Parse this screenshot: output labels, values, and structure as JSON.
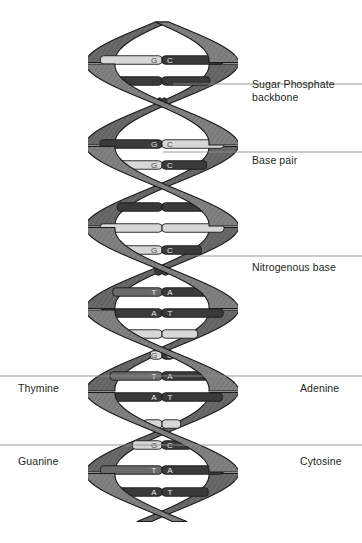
{
  "diagram": {
    "background_color": "#ffffff",
    "ribbon_color": "#7c7b7b",
    "ribbon_dark_color": "#5d5c5c",
    "ribbon_outline_color": "#1a1a1a",
    "rung_dark_color": "#3a3a3a",
    "rung_light_color": "#d7d7d7",
    "rung_mid_color": "#6a6a6a",
    "letter_color": "#e8e8e8",
    "leader_line_color": "#8c8c8c",
    "text_color": "#231f20"
  },
  "labels": [
    {
      "id": "sugar-phosphate-backbone",
      "text": "Sugar Phosphate\nbackbone",
      "side": "right",
      "x": 252,
      "y": 78,
      "leader_y": 84,
      "leader_x1": 173,
      "leader_x2": 362
    },
    {
      "id": "base-pair",
      "text": "Base pair",
      "side": "right",
      "x": 252,
      "y": 154,
      "leader_y": 152,
      "leader_x1": 163,
      "leader_x2": 362
    },
    {
      "id": "nitrogenous-base",
      "text": "Nitrogenous base",
      "side": "right",
      "x": 252,
      "y": 261,
      "leader_y": 256,
      "leader_x1": 196,
      "leader_x2": 362
    },
    {
      "id": "thymine",
      "text": "Thymine",
      "side": "left",
      "x": 18,
      "y": 382,
      "leader_y": 376,
      "leader_x1": 0,
      "leader_x2": 181
    },
    {
      "id": "adenine",
      "text": "Adenine",
      "side": "right",
      "x": 300,
      "y": 382,
      "leader_y": 376,
      "leader_x1": 181,
      "leader_x2": 362
    },
    {
      "id": "guanine",
      "text": "Guanine",
      "side": "left",
      "x": 18,
      "y": 455,
      "leader_y": 445,
      "leader_x1": 0,
      "leader_x2": 181
    },
    {
      "id": "cytosine",
      "text": "Cytosine",
      "side": "right",
      "x": 300,
      "y": 455,
      "leader_y": 445,
      "leader_x1": 181,
      "leader_x2": 362
    }
  ],
  "chart_data": {
    "type": "diagram",
    "helix": {
      "axis_x": 162,
      "top_y": 22,
      "bottom_y": 522,
      "amplitude": 62,
      "period": 164,
      "ribbon_width": 15,
      "turns": 3
    },
    "base_pairs": [
      {
        "index": 0,
        "y": 60,
        "left": "G",
        "right": "C",
        "left_shade": "light",
        "right_shade": "dark",
        "visible": true
      },
      {
        "index": 1,
        "y": 81,
        "left": "",
        "right": "",
        "left_shade": "dark",
        "right_shade": "dark",
        "visible": false
      },
      {
        "index": 2,
        "y": 102,
        "left": "",
        "right": "",
        "left_shade": "dark",
        "right_shade": "dark",
        "visible": false
      },
      {
        "index": 3,
        "y": 144,
        "left": "G",
        "right": "C",
        "left_shade": "dark",
        "right_shade": "light",
        "visible": true
      },
      {
        "index": 4,
        "y": 165,
        "left": "G",
        "right": "C",
        "left_shade": "light",
        "right_shade": "dark",
        "visible": true
      },
      {
        "index": 5,
        "y": 186,
        "left": "T",
        "right": "A",
        "left_shade": "mid",
        "right_shade": "dark",
        "visible": true
      },
      {
        "index": 6,
        "y": 207,
        "left": "",
        "right": "",
        "left_shade": "dark",
        "right_shade": "dark",
        "visible": false
      },
      {
        "index": 7,
        "y": 228,
        "left": "",
        "right": "",
        "left_shade": "light",
        "right_shade": "light",
        "visible": false
      },
      {
        "index": 8,
        "y": 250,
        "left": "G",
        "right": "C",
        "left_shade": "light",
        "right_shade": "dark",
        "visible": true
      },
      {
        "index": 9,
        "y": 271,
        "left": "",
        "right": "",
        "left_shade": "dark",
        "right_shade": "dark",
        "visible": false
      },
      {
        "index": 10,
        "y": 292,
        "left": "T",
        "right": "A",
        "left_shade": "mid",
        "right_shade": "dark",
        "visible": true
      },
      {
        "index": 11,
        "y": 313,
        "left": "A",
        "right": "T",
        "left_shade": "dark",
        "right_shade": "dark",
        "visible": true
      },
      {
        "index": 12,
        "y": 334,
        "left": "",
        "right": "",
        "left_shade": "light",
        "right_shade": "light",
        "visible": false
      },
      {
        "index": 13,
        "y": 355,
        "left": "G",
        "right": "C",
        "left_shade": "light",
        "right_shade": "dark",
        "visible": true
      },
      {
        "index": 14,
        "y": 376,
        "left": "T",
        "right": "A",
        "left_shade": "mid",
        "right_shade": "dark",
        "visible": true
      },
      {
        "index": 15,
        "y": 397,
        "left": "A",
        "right": "T",
        "left_shade": "dark",
        "right_shade": "dark",
        "visible": true
      },
      {
        "index": 16,
        "y": 424,
        "left": "",
        "right": "",
        "left_shade": "light",
        "right_shade": "light",
        "visible": false
      },
      {
        "index": 17,
        "y": 445,
        "left": "G",
        "right": "C",
        "left_shade": "light",
        "right_shade": "dark",
        "visible": true
      },
      {
        "index": 18,
        "y": 470,
        "left": "T",
        "right": "A",
        "left_shade": "mid",
        "right_shade": "dark",
        "visible": true
      },
      {
        "index": 19,
        "y": 492,
        "left": "A",
        "right": "T",
        "left_shade": "dark",
        "right_shade": "dark",
        "visible": true
      }
    ],
    "legend": [
      {
        "symbol": "A",
        "name": "Adenine"
      },
      {
        "symbol": "T",
        "name": "Thymine"
      },
      {
        "symbol": "G",
        "name": "Guanine"
      },
      {
        "symbol": "C",
        "name": "Cytosine"
      }
    ]
  }
}
